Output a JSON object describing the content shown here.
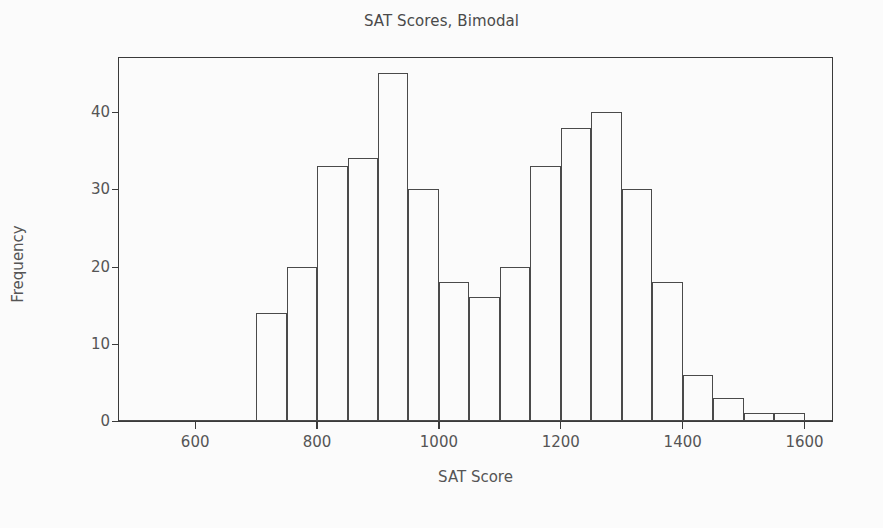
{
  "chart_data": {
    "type": "bar",
    "title": "SAT Scores, Bimodal",
    "xlabel": "SAT Score",
    "ylabel": "Frequency",
    "xlim": [
      475,
      1645
    ],
    "ylim": [
      0,
      47
    ],
    "grid": false,
    "legend": null,
    "bin_width": 50,
    "bin_edges": [
      700,
      750,
      800,
      850,
      900,
      950,
      1000,
      1050,
      1100,
      1150,
      1200,
      1250,
      1300,
      1350,
      1400,
      1450,
      1500,
      1550,
      1600
    ],
    "categories": [
      "700-750",
      "750-800",
      "800-850",
      "850-900",
      "900-950",
      "950-1000",
      "1000-1050",
      "1050-1100",
      "1100-1150",
      "1150-1200",
      "1200-1250",
      "1250-1300",
      "1300-1350",
      "1350-1400",
      "1400-1450",
      "1450-1500",
      "1500-1550",
      "1550-1600"
    ],
    "values": [
      14,
      20,
      33,
      34,
      45,
      30,
      18,
      16,
      20,
      33,
      38,
      40,
      30,
      18,
      6,
      3,
      1,
      1
    ],
    "xticks": [
      600,
      800,
      1000,
      1200,
      1400,
      1600
    ],
    "xtick_labels": [
      "600",
      "800",
      "1000",
      "1200",
      "1400",
      "1600"
    ],
    "yticks": [
      0,
      10,
      20,
      30,
      40
    ],
    "ytick_labels": [
      "0",
      "10",
      "20",
      "30",
      "40"
    ],
    "colors": {
      "background": "#fbfbfb",
      "bar_fill": "transparent",
      "bar_edge": "#4a4a4a",
      "axis": "#3a3a3a",
      "text": "#555555",
      "title_text": "#4a4a4a"
    }
  }
}
